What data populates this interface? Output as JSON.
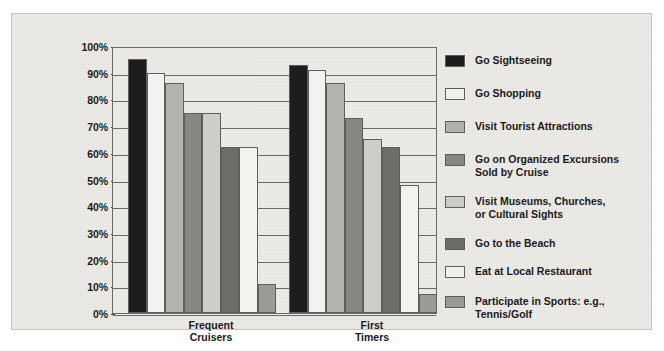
{
  "chart_data": {
    "type": "bar",
    "title": "",
    "subtitle": "",
    "xlabel": "",
    "ylabel": "",
    "categories": [
      "Frequent\nCruisers",
      "First\nTimers"
    ],
    "ylim": [
      0,
      100
    ],
    "ytick_labels": [
      "100%",
      "90%",
      "80%",
      "70%",
      "60%",
      "50%",
      "40%",
      "30%",
      "20%",
      "10%",
      "0%"
    ],
    "ytick_values": [
      100,
      90,
      80,
      70,
      60,
      50,
      40,
      30,
      20,
      10,
      0
    ],
    "grid": true,
    "legend_position": "right",
    "series": [
      {
        "name": "Go Sightseeing",
        "color": "#1d1d1d",
        "values": [
          95,
          93
        ]
      },
      {
        "name": "Go Shopping",
        "color": "#f4f2ee",
        "values": [
          90,
          91
        ]
      },
      {
        "name": "Visit Tourist Attractions",
        "color": "#b4b2ad",
        "values": [
          86,
          86
        ]
      },
      {
        "name": "Go on Organized Excursions\nSold by Cruise",
        "color": "#878682",
        "values": [
          75,
          73
        ]
      },
      {
        "name": "Visit Museums, Churches,\nor Cultural Sights",
        "color": "#cfcdc8",
        "values": [
          75,
          65
        ]
      },
      {
        "name": "Go to the Beach",
        "color": "#6d6c69",
        "values": [
          62,
          62
        ]
      },
      {
        "name": "Eat at Local Restaurant",
        "color": "#f4f2ee",
        "values": [
          62,
          48
        ]
      },
      {
        "name": "Participate in Sports: e.g.,\nTennis/Golf",
        "color": "#9c9a96",
        "values": [
          11,
          7
        ]
      }
    ]
  },
  "legend": {
    "items": [
      {
        "label": "Go Sightseeing",
        "color": "#1d1d1d"
      },
      {
        "label": "Go Shopping",
        "color": "#f4f2ee"
      },
      {
        "label": "Visit Tourist Attractions",
        "color": "#b4b2ad"
      },
      {
        "label": "Go on Organized Excursions\nSold by Cruise",
        "color": "#878682"
      },
      {
        "label": "Visit Museums, Churches,\nor Cultural Sights",
        "color": "#cfcdc8"
      },
      {
        "label": "Go to the Beach",
        "color": "#6d6c69"
      },
      {
        "label": "Eat at Local Restaurant",
        "color": "#f4f2ee"
      },
      {
        "label": "Participate in Sports: e.g.,\nTennis/Golf",
        "color": "#9c9a96"
      }
    ]
  },
  "colors": {
    "panel_background": "#eceae6",
    "plot_background": "#edebe7",
    "axis": "#6b6b6b",
    "text": "#1a1a1a"
  }
}
